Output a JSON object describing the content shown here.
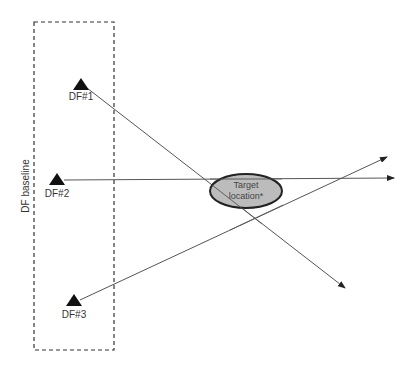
{
  "diagram": {
    "baseline": {
      "label": "DF baseline",
      "box": {
        "x": 34,
        "y": 22,
        "width": 80,
        "height": 328
      }
    },
    "stations": [
      {
        "id": "df1",
        "label": "DF#1",
        "x": 81,
        "y": 87
      },
      {
        "id": "df2",
        "label": "DF#2",
        "x": 57,
        "y": 180
      },
      {
        "id": "df3",
        "label": "DF#3",
        "x": 74,
        "y": 302
      }
    ],
    "bearings": [
      {
        "from": "df1",
        "x1": 87,
        "y1": 88,
        "x2": 345,
        "y2": 288
      },
      {
        "from": "df2",
        "x1": 64,
        "y1": 180,
        "x2": 394,
        "y2": 178
      },
      {
        "from": "df3",
        "x1": 80,
        "y1": 300,
        "x2": 387,
        "y2": 157
      }
    ],
    "target": {
      "line1": "Target",
      "line2": "location*",
      "cx": 246,
      "cy": 191,
      "rx": 36,
      "ry": 17,
      "fill": "#b0b0b0",
      "stroke": "#222222"
    },
    "colors": {
      "line": "#555555",
      "marker": "#111111",
      "dash": "#333333"
    }
  }
}
